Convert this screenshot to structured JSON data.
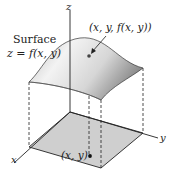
{
  "figure": {
    "surface_label": "Surface",
    "surface_equation": "z = f(x, y)",
    "surface_point_label": "(x, y, f(x, y))",
    "domain_point_label": "(x, y)",
    "axes": {
      "x": "x",
      "y": "y",
      "z": "z"
    },
    "colors": {
      "domain_fill": "#cfcfcf",
      "surface_light": "#f4f4f4",
      "surface_dark": "#9a9a9a",
      "line": "#222222"
    }
  }
}
